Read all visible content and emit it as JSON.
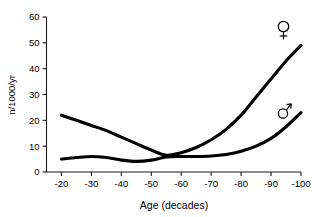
{
  "chart_data": {
    "type": "line",
    "title": "",
    "xlabel": "Age (decades)",
    "ylabel": "n/1000/yr",
    "xlim": [
      -15,
      -100
    ],
    "ylim": [
      0,
      60
    ],
    "grid": false,
    "legend_position": "inline-right",
    "x_ticks": [
      "-20",
      "-30",
      "-40",
      "-50",
      "-60",
      "-70",
      "-80",
      "-90",
      "-100"
    ],
    "x_tick_values": [
      -20,
      -30,
      -40,
      -50,
      -60,
      -70,
      -80,
      -90,
      -100
    ],
    "y_ticks": [
      "0",
      "10",
      "20",
      "30",
      "40",
      "50",
      "60"
    ],
    "y_tick_values": [
      0,
      10,
      20,
      30,
      40,
      50,
      60
    ],
    "x": [
      -20,
      -25,
      -30,
      -35,
      -40,
      -45,
      -50,
      -55,
      -60,
      -65,
      -70,
      -75,
      -80,
      -85,
      -90,
      -95,
      -100
    ],
    "series": [
      {
        "name": "female",
        "symbol": "♀",
        "label": "female-symbol",
        "values": [
          22,
          20,
          18,
          16,
          13.5,
          11,
          8.5,
          6.5,
          7.5,
          9.5,
          12.5,
          16.5,
          22,
          29,
          36,
          43,
          49
        ]
      },
      {
        "name": "male",
        "symbol": "♂",
        "label": "male-symbol",
        "values": [
          5,
          5.6,
          6,
          5.6,
          4.6,
          4.1,
          4.6,
          5.8,
          6,
          6,
          6.2,
          6.8,
          8,
          10,
          13,
          17.5,
          23
        ]
      }
    ],
    "annotations": [
      {
        "name": "female-symbol",
        "text": "♀",
        "x": -97,
        "y": 53
      },
      {
        "name": "male-symbol",
        "text": "♂",
        "x": -97,
        "y": 26.5
      }
    ],
    "colors": {
      "curve": "#000000",
      "axis": "#1a1a1a",
      "background": "#ffffff"
    }
  }
}
